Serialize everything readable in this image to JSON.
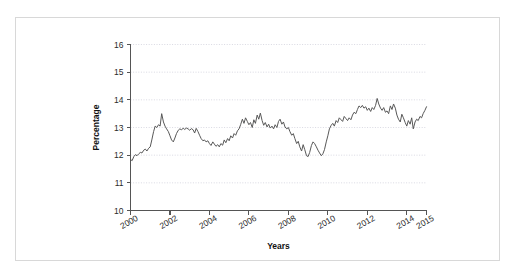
{
  "figure": {
    "frame_color": "#d8d8d8",
    "background": "#ffffff"
  },
  "axis": {
    "ylabel": "Percentage",
    "xlabel": "Years"
  },
  "chart_data": {
    "type": "line",
    "title": "",
    "subtitle": "",
    "xlabel": "Years",
    "ylabel": "Percentage",
    "xlim": [
      2000,
      2015
    ],
    "ylim": [
      10,
      16
    ],
    "xticks": [
      2000,
      2002,
      2004,
      2006,
      2008,
      2010,
      2012,
      2014,
      2015
    ],
    "xticklabels": [
      "2000",
      "2002",
      "2004",
      "2006",
      "2008",
      "2010",
      "2012",
      "2014",
      "2015"
    ],
    "yticks": [
      10,
      11,
      12,
      13,
      14,
      15,
      16
    ],
    "yticklabels": [
      "10",
      "11",
      "12",
      "13",
      "14",
      "15",
      "16"
    ],
    "grid": "horizontal-dotted",
    "legend": null,
    "line_color": "#585858",
    "series": [
      {
        "name": "Percentage",
        "x": [
          2000.0,
          2000.08,
          2000.17,
          2000.25,
          2000.33,
          2000.42,
          2000.5,
          2000.58,
          2000.67,
          2000.75,
          2000.83,
          2000.92,
          2001.0,
          2001.08,
          2001.17,
          2001.25,
          2001.33,
          2001.42,
          2001.5,
          2001.58,
          2001.67,
          2001.75,
          2001.83,
          2001.92,
          2002.0,
          2002.08,
          2002.17,
          2002.25,
          2002.33,
          2002.42,
          2002.5,
          2002.58,
          2002.67,
          2002.75,
          2002.83,
          2002.92,
          2003.0,
          2003.08,
          2003.17,
          2003.25,
          2003.33,
          2003.42,
          2003.5,
          2003.58,
          2003.67,
          2003.75,
          2003.83,
          2003.92,
          2004.0,
          2004.08,
          2004.17,
          2004.25,
          2004.33,
          2004.42,
          2004.5,
          2004.58,
          2004.67,
          2004.75,
          2004.83,
          2004.92,
          2005.0,
          2005.08,
          2005.17,
          2005.25,
          2005.33,
          2005.42,
          2005.5,
          2005.58,
          2005.67,
          2005.75,
          2005.83,
          2005.92,
          2006.0,
          2006.08,
          2006.17,
          2006.25,
          2006.33,
          2006.42,
          2006.5,
          2006.58,
          2006.67,
          2006.75,
          2006.83,
          2006.92,
          2007.0,
          2007.08,
          2007.17,
          2007.25,
          2007.33,
          2007.42,
          2007.5,
          2007.58,
          2007.67,
          2007.75,
          2007.83,
          2007.92,
          2008.0,
          2008.08,
          2008.17,
          2008.25,
          2008.33,
          2008.42,
          2008.5,
          2008.58,
          2008.67,
          2008.75,
          2008.83,
          2008.92,
          2009.0,
          2009.08,
          2009.17,
          2009.25,
          2009.33,
          2009.42,
          2009.5,
          2009.58,
          2009.67,
          2009.75,
          2009.83,
          2009.92,
          2010.0,
          2010.08,
          2010.17,
          2010.25,
          2010.33,
          2010.42,
          2010.5,
          2010.58,
          2010.67,
          2010.75,
          2010.83,
          2010.92,
          2011.0,
          2011.08,
          2011.17,
          2011.25,
          2011.33,
          2011.42,
          2011.5,
          2011.58,
          2011.67,
          2011.75,
          2011.83,
          2011.92,
          2012.0,
          2012.08,
          2012.17,
          2012.25,
          2012.33,
          2012.42,
          2012.5,
          2012.58,
          2012.67,
          2012.75,
          2012.83,
          2012.92,
          2013.0,
          2013.08,
          2013.17,
          2013.25,
          2013.33,
          2013.42,
          2013.5,
          2013.58,
          2013.67,
          2013.75,
          2013.83,
          2013.92,
          2014.0,
          2014.08,
          2014.17,
          2014.25,
          2014.33,
          2014.42,
          2014.5,
          2014.58,
          2014.67,
          2014.75,
          2014.83,
          2014.92,
          2015.0
        ],
        "values": [
          11.85,
          11.8,
          11.95,
          12.02,
          11.98,
          12.05,
          12.1,
          12.08,
          12.18,
          12.22,
          12.15,
          12.25,
          12.3,
          12.55,
          12.85,
          13.05,
          13.0,
          13.1,
          13.05,
          13.5,
          13.2,
          13.05,
          12.95,
          12.85,
          12.7,
          12.55,
          12.48,
          12.62,
          12.78,
          12.9,
          12.95,
          12.92,
          12.97,
          12.93,
          12.98,
          12.95,
          12.9,
          12.96,
          12.92,
          12.8,
          12.97,
          12.85,
          12.72,
          12.6,
          12.52,
          12.55,
          12.48,
          12.52,
          12.42,
          12.35,
          12.48,
          12.4,
          12.32,
          12.38,
          12.3,
          12.42,
          12.36,
          12.55,
          12.45,
          12.6,
          12.52,
          12.7,
          12.62,
          12.78,
          12.72,
          12.88,
          12.95,
          13.1,
          13.3,
          13.15,
          13.35,
          13.22,
          13.1,
          13.18,
          13.0,
          13.28,
          13.15,
          13.45,
          13.3,
          13.52,
          13.25,
          13.08,
          13.18,
          13.02,
          13.12,
          12.98,
          13.05,
          12.95,
          13.1,
          13.0,
          13.22,
          13.3,
          13.12,
          13.2,
          13.02,
          12.95,
          13.0,
          12.85,
          12.72,
          12.78,
          12.6,
          12.42,
          12.5,
          12.3,
          12.15,
          12.38,
          12.2,
          11.98,
          11.95,
          12.1,
          12.35,
          12.48,
          12.42,
          12.3,
          12.18,
          12.08,
          11.98,
          12.05,
          12.2,
          12.48,
          12.7,
          12.95,
          13.08,
          13.15,
          13.05,
          13.25,
          13.18,
          13.35,
          13.28,
          13.22,
          13.4,
          13.32,
          13.25,
          13.35,
          13.28,
          13.45,
          13.55,
          13.5,
          13.65,
          13.78,
          13.72,
          13.8,
          13.7,
          13.75,
          13.62,
          13.7,
          13.58,
          13.72,
          13.65,
          13.8,
          14.05,
          13.85,
          13.7,
          13.62,
          13.72,
          13.55,
          13.6,
          13.5,
          13.78,
          13.65,
          13.85,
          13.7,
          13.45,
          13.3,
          13.2,
          13.48,
          13.35,
          13.18,
          13.05,
          13.25,
          13.12,
          13.35,
          12.95,
          13.2,
          13.3,
          13.25,
          13.4,
          13.35,
          13.5,
          13.62,
          13.75
        ]
      }
    ]
  }
}
